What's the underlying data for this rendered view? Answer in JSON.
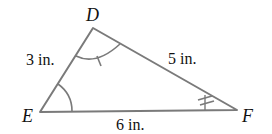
{
  "diagram": {
    "type": "triangle",
    "stroke_color": "#7a7a7a",
    "vertices": {
      "D": {
        "label": "D"
      },
      "E": {
        "label": "E"
      },
      "F": {
        "label": "F"
      }
    },
    "sides": {
      "DE": {
        "label": "3 in."
      },
      "DF": {
        "label": "5 in."
      },
      "EF": {
        "label": "6 in."
      }
    },
    "angle_marks": {
      "D": "single arc with one tick",
      "E": "single arc",
      "F": "double tick"
    }
  }
}
